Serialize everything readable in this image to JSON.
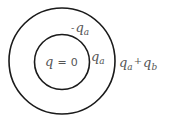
{
  "diagram": {
    "outer_circle": {
      "cx": 62,
      "cy": 61,
      "r": 53
    },
    "inner_circle": {
      "cx": 62,
      "cy": 62,
      "r": 27.5
    },
    "stroke_color": "#1a1a1a",
    "labels": {
      "center": {
        "symbol": "q",
        "equals": "=",
        "value": "0"
      },
      "inner_surface_outer_shell": {
        "sign": "-",
        "symbol": "q",
        "sub": "a"
      },
      "inner_sphere_surface": {
        "symbol": "q",
        "sub": "a"
      },
      "outer_surface": {
        "symbol1": "q",
        "sub1": "a",
        "op": "+",
        "symbol2": "q",
        "sub2": "b"
      }
    }
  }
}
